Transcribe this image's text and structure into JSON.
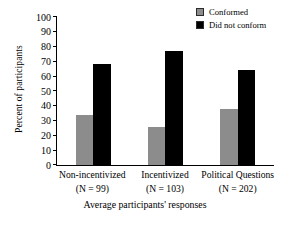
{
  "chart_data": {
    "type": "bar",
    "title": "",
    "xlabel": "Average participants' responses",
    "ylabel": "Percent of participants",
    "ylim": [
      0,
      100
    ],
    "yticks": [
      0,
      10,
      20,
      30,
      40,
      50,
      60,
      70,
      80,
      90,
      100
    ],
    "grid": false,
    "legend_position": "top-right",
    "categories": [
      "Non-incentivized",
      "Incentivized",
      "Political Questions"
    ],
    "category_sublabels": [
      "(N = 99)",
      "(N = 103)",
      "(N = 202)"
    ],
    "series": [
      {
        "name": "Conformed",
        "color": "#8c8c8c",
        "values": [
          34,
          26,
          38
        ]
      },
      {
        "name": "Did not conform",
        "color": "#000000",
        "values": [
          68,
          77,
          64
        ]
      }
    ]
  },
  "axis": {
    "y_title": "Percent of participants",
    "x_title": "Average participants' responses",
    "y_tick_labels": [
      "100",
      "90",
      "80",
      "70",
      "60",
      "50",
      "40",
      "30",
      "20",
      "10",
      "0"
    ]
  },
  "legend": {
    "items": [
      {
        "label": "Conformed",
        "swatch": "gray"
      },
      {
        "label": "Did not conform",
        "swatch": "black"
      }
    ]
  },
  "groups": [
    {
      "label": "Non-incentivized",
      "n": "(N = 99)",
      "conformed": 34,
      "did_not_conform": 68
    },
    {
      "label": "Incentivized",
      "n": "(N = 103)",
      "conformed": 26,
      "did_not_conform": 77
    },
    {
      "label": "Political Questions",
      "n": "(N = 202)",
      "conformed": 38,
      "did_not_conform": 64
    }
  ]
}
